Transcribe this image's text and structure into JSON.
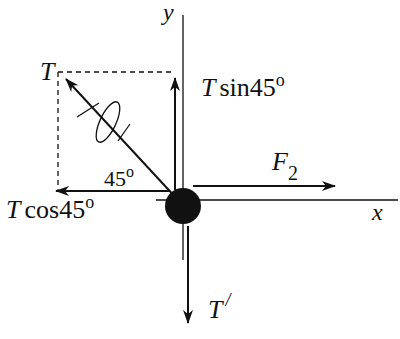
{
  "diagram": {
    "type": "free-body-diagram",
    "colors": {
      "ink": "#111111",
      "background": "#ffffff"
    },
    "axes": {
      "x_label": "x",
      "y_label": "y"
    },
    "angle": {
      "value": "45",
      "unit": "o"
    },
    "forces": {
      "T": {
        "symbol": "T"
      },
      "T_sin": {
        "symbol": "T",
        "func": "sin45",
        "deg": "o"
      },
      "T_cos": {
        "symbol": "T",
        "func": "cos45",
        "deg": "o"
      },
      "F2": {
        "symbol": "F",
        "sub": "2"
      },
      "T_prime": {
        "symbol": "T",
        "prime": "/"
      }
    },
    "rope_icon": "rope-loop-icon"
  }
}
